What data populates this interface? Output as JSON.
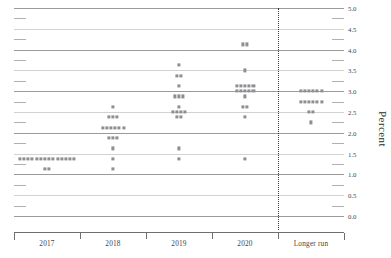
{
  "chart_data": {
    "type": "scatter",
    "title": "",
    "xlabel": "",
    "ylabel": "Percent",
    "ylim": [
      0.0,
      5.0
    ],
    "ytick_step": 0.5,
    "minor_tick_step": 0.25,
    "grid": true,
    "legend": "none",
    "categories": [
      "2017",
      "2018",
      "2019",
      "2020",
      "Longer run"
    ],
    "annotations": [
      "dotted vertical divider before Longer run"
    ],
    "yticks": [
      "0.0",
      "0.5",
      "1.0",
      "1.5",
      "2.0",
      "2.5",
      "3.0",
      "3.5",
      "4.0",
      "4.5",
      "5.0"
    ],
    "series": [
      {
        "name": "2017",
        "points": [
          {
            "value": 1.375,
            "count": 14
          },
          {
            "value": 1.125,
            "count": 2
          }
        ]
      },
      {
        "name": "2018",
        "points": [
          {
            "value": 2.625,
            "count": 1
          },
          {
            "value": 2.375,
            "count": 3
          },
          {
            "value": 2.125,
            "count": 6
          },
          {
            "value": 1.875,
            "count": 3
          },
          {
            "value": 1.625,
            "count": 1
          },
          {
            "value": 1.375,
            "count": 1
          },
          {
            "value": 1.125,
            "count": 1
          }
        ]
      },
      {
        "name": "2019",
        "points": [
          {
            "value": 3.625,
            "count": 1
          },
          {
            "value": 3.375,
            "count": 2
          },
          {
            "value": 3.125,
            "count": 1
          },
          {
            "value": 2.875,
            "count": 3
          },
          {
            "value": 2.625,
            "count": 1
          },
          {
            "value": 2.5,
            "count": 4
          },
          {
            "value": 2.375,
            "count": 2
          },
          {
            "value": 1.625,
            "count": 1
          },
          {
            "value": 1.375,
            "count": 1
          }
        ]
      },
      {
        "name": "2020",
        "points": [
          {
            "value": 4.125,
            "count": 2
          },
          {
            "value": 3.5,
            "count": 1
          },
          {
            "value": 3.125,
            "count": 5
          },
          {
            "value": 3.0,
            "count": 5
          },
          {
            "value": 2.875,
            "count": 1
          },
          {
            "value": 2.625,
            "count": 2
          },
          {
            "value": 2.375,
            "count": 1
          },
          {
            "value": 1.375,
            "count": 1
          }
        ]
      },
      {
        "name": "Longer run",
        "points": [
          {
            "value": 3.0,
            "count": 6
          },
          {
            "value": 2.75,
            "count": 6
          },
          {
            "value": 2.5,
            "count": 2
          },
          {
            "value": 2.25,
            "count": 1
          }
        ]
      }
    ]
  },
  "axis": {
    "y_title": "Percent",
    "y_ticks": [
      "5.0",
      "4.5",
      "4.0",
      "3.5",
      "3.0",
      "2.5",
      "2.0",
      "1.5",
      "1.0",
      "0.5",
      "0.0"
    ],
    "x_labels": [
      "2017",
      "2018",
      "2019",
      "2020",
      "Longer run"
    ]
  },
  "colors": {
    "dot": "#8e8e93",
    "gridline_major": "#9a9a9a",
    "gridline_minor": "#d2d2d2",
    "axis": "#6f6f6f",
    "divider": "#3a3a3a",
    "text": "#3f3f3f",
    "background": "#ffffff"
  }
}
